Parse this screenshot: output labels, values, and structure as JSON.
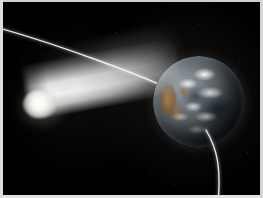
{
  "image": {
    "title": "Comet approaching Earth",
    "caption": "Artist illustration of a bright comet with a broad dust tail passing close to planet Earth along a curved trajectory",
    "alt_text": "A glowing white comet with a wide luminous tail streaks from the lower left toward planet Earth on the right, while a thin white curve traces its orbital path from the upper left across the globe and down out of frame at the bottom right.",
    "width_px": "263",
    "height_px": "198",
    "background_color": "#000000",
    "border_color": "#d8d8d8"
  },
  "scene": {
    "background_label": "Deep space",
    "objects": [
      {
        "name": "comet-nucleus",
        "label": "Comet nucleus",
        "description": "Bright rounded coma glow at the head of the comet",
        "color": "#ffffff",
        "position_px": {
          "x": "37",
          "y": "102"
        },
        "size_px": {
          "width": "34",
          "height": "28"
        }
      },
      {
        "name": "comet-tail",
        "label": "Comet tail",
        "description": "Broad luminous dust tail widening from the nucleus toward Earth",
        "color": "#f6f6f6",
        "angle_deg": "-10.5",
        "length_px": "158"
      },
      {
        "name": "earth",
        "label": "Earth",
        "description": "Partially lit globe showing white cloud swirls, dark oceans and a tan ochre landmass on the left limb",
        "ocean_color": "#2b3138",
        "land_color": "#a67c4a",
        "cloud_color": "#f2f2f0",
        "shadow_color": "#030405",
        "position_px": {
          "x": "196",
          "y": "100"
        },
        "diameter_px": "92"
      },
      {
        "name": "trajectory-arc",
        "label": "Trajectory path",
        "description": "Thin white curve marking the comet orbital path, entering upper left and exiting bottom right",
        "color": "#f2f2f2",
        "stroke_width_px": "1.35",
        "entry_point_px": {
          "x": "0",
          "y": "27"
        },
        "exit_point_px": {
          "x": "215",
          "y": "195"
        }
      }
    ],
    "stars": [
      {
        "x": "30",
        "y": "160",
        "size": "1",
        "opacity": "0.20"
      },
      {
        "x": "64",
        "y": "176",
        "size": "1",
        "opacity": "0.16"
      },
      {
        "x": "112",
        "y": "30",
        "size": "1",
        "opacity": "0.22"
      },
      {
        "x": "196",
        "y": "22",
        "size": "1",
        "opacity": "0.18"
      },
      {
        "x": "236",
        "y": "60",
        "size": "1",
        "opacity": "0.15"
      },
      {
        "x": "244",
        "y": "150",
        "size": "1",
        "opacity": "0.20"
      },
      {
        "x": "172",
        "y": "182",
        "size": "1",
        "opacity": "0.14"
      },
      {
        "x": "86",
        "y": "18",
        "size": "1",
        "opacity": "0.17"
      },
      {
        "x": "148",
        "y": "168",
        "size": "1",
        "opacity": "0.13"
      },
      {
        "x": "20",
        "y": "58",
        "size": "1",
        "opacity": "0.12"
      }
    ]
  }
}
